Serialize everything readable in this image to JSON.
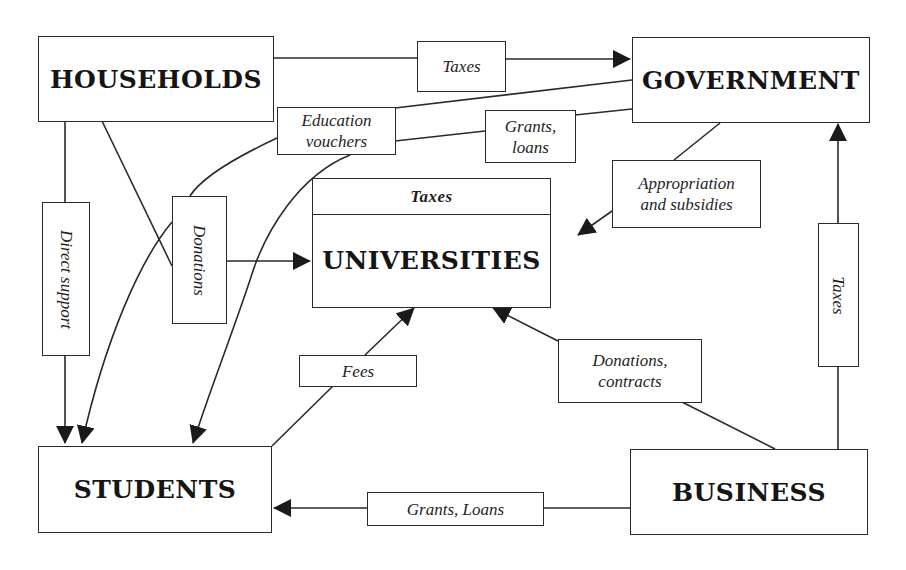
{
  "diagram": {
    "title": "",
    "colors": {
      "line": "#2a2a2a",
      "text": "#1a1a1a",
      "background": "#ffffff"
    },
    "entities": {
      "households": "HOUSEHOLDS",
      "government": "GOVERNMENT",
      "universities": "UNIVERSITIES",
      "students": "STUDENTS",
      "business": "BUSINESS"
    },
    "universities_band_label": "Taxes",
    "flows": {
      "households_to_government": "Taxes",
      "education_vouchers": [
        "Education",
        "vouchers"
      ],
      "grants_loans_gov": [
        "Grants,",
        "loans"
      ],
      "appropriation": [
        "Appropriation",
        "and subsidies"
      ],
      "direct_support": "Direct support",
      "donations_households": "Donations",
      "fees": "Fees",
      "donations_contracts": [
        "Donations,",
        "contracts"
      ],
      "business_taxes": "Taxes",
      "grants_loans_business": "Grants, Loans"
    },
    "edges": [
      {
        "from": "HOUSEHOLDS",
        "to": "GOVERNMENT",
        "label": "Taxes"
      },
      {
        "from": "GOVERNMENT",
        "to": "STUDENTS",
        "label": "Education vouchers"
      },
      {
        "from": "GOVERNMENT",
        "to": "STUDENTS",
        "label": "Grants, loans"
      },
      {
        "from": "GOVERNMENT",
        "to": "UNIVERSITIES",
        "label": "Appropriation and subsidies"
      },
      {
        "from": "HOUSEHOLDS",
        "to": "STUDENTS",
        "label": "Direct support"
      },
      {
        "from": "HOUSEHOLDS",
        "to": "UNIVERSITIES",
        "label": "Donations"
      },
      {
        "from": "STUDENTS",
        "to": "UNIVERSITIES",
        "label": "Fees"
      },
      {
        "from": "BUSINESS",
        "to": "UNIVERSITIES",
        "label": "Donations, contracts"
      },
      {
        "from": "BUSINESS",
        "to": "GOVERNMENT",
        "label": "Taxes"
      },
      {
        "from": "BUSINESS",
        "to": "STUDENTS",
        "label": "Grants, Loans"
      }
    ]
  }
}
